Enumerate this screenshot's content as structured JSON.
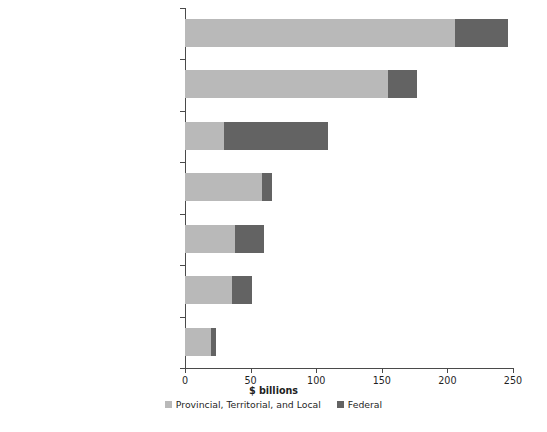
{
  "chart_data": {
    "type": "bar",
    "orientation": "horizontal",
    "stacked": true,
    "title": "",
    "xlabel": "$ billions",
    "ylabel": "",
    "xlim": [
      0,
      250
    ],
    "xticks": [
      0,
      50,
      100,
      150,
      200,
      250
    ],
    "xtick_labels": [
      "0",
      "50",
      "100",
      "150",
      "200",
      "250"
    ],
    "grid": false,
    "legend_position": "bottom",
    "categories": [
      "Public Employee Compensation",
      "Cost of Government Operations and Service Contracts",
      "Fiscal and Social Security Benefit Payments to Individuals",
      "Infrastructure Investments (capital consumption)",
      "Debt Charges",
      "Other Expenses",
      "Business Subsidies"
    ],
    "category_lines": [
      [
        "Public Employee",
        "Compensation"
      ],
      [
        "Cost of Government Operations",
        "and Service Contracts"
      ],
      [
        "Fiscal and Social Security Benefit",
        "Payments to Individuals"
      ],
      [
        "Infrastructure Investments",
        "(capital consumption)"
      ],
      [
        "Debt Charges"
      ],
      [
        "Other Expenses"
      ],
      [
        "Business Subsidies"
      ]
    ],
    "series": [
      {
        "name": "Provincial, Territorial, and Local",
        "color": "#b9b9b9",
        "values": [
          206,
          155,
          30,
          59,
          38,
          36,
          20
        ]
      },
      {
        "name": "Federal",
        "color": "#636363",
        "values": [
          40,
          22,
          79,
          7,
          22,
          15,
          4
        ]
      }
    ],
    "totals": [
      246,
      177,
      109,
      66,
      60,
      51,
      24
    ]
  },
  "colors": {
    "axis": "#4a4a4a",
    "text": "#1f1f1f",
    "background": "#ffffff",
    "series_provincial": "#b9b9b9",
    "series_federal": "#636363"
  }
}
